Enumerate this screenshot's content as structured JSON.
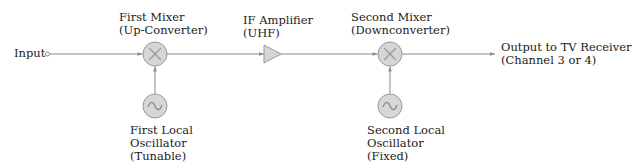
{
  "diagram": {
    "type": "block-diagram",
    "colors": {
      "line": "#8a8a8a",
      "block_fill": "#d6d6d6",
      "block_stroke": "#9a9a9a",
      "symbol": "#9a9a9a",
      "text": "#222222"
    },
    "input": {
      "label": "Input"
    },
    "first_mixer": {
      "line1": "First Mixer",
      "line2": "(Up-Converter)",
      "symbol": "multiply-icon"
    },
    "first_oscillator": {
      "line1": "First Local",
      "line2": "Oscillator",
      "line3": "(Tunable)",
      "symbol": "sine-wave-icon"
    },
    "if_amplifier": {
      "line1": "IF Amplifier",
      "line2": "(UHF)",
      "symbol": "triangle-amplifier-icon"
    },
    "second_mixer": {
      "line1": "Second Mixer",
      "line2": "(Downconverter)",
      "symbol": "multiply-icon"
    },
    "second_oscillator": {
      "line1": "Second Local",
      "line2": "Oscillator",
      "line3": "(Fixed)",
      "symbol": "sine-wave-icon"
    },
    "output": {
      "line1": "Output to TV Receiver",
      "line2": "(Channel 3 or 4)"
    },
    "nodes": [
      "Input",
      "First Mixer",
      "IF Amplifier",
      "Second Mixer",
      "Output to TV Receiver"
    ],
    "edges": [
      {
        "from": "Input",
        "to": "First Mixer"
      },
      {
        "from": "First Local Oscillator",
        "to": "First Mixer"
      },
      {
        "from": "First Mixer",
        "to": "IF Amplifier"
      },
      {
        "from": "IF Amplifier",
        "to": "Second Mixer"
      },
      {
        "from": "Second Local Oscillator",
        "to": "Second Mixer"
      },
      {
        "from": "Second Mixer",
        "to": "Output to TV Receiver"
      }
    ]
  }
}
